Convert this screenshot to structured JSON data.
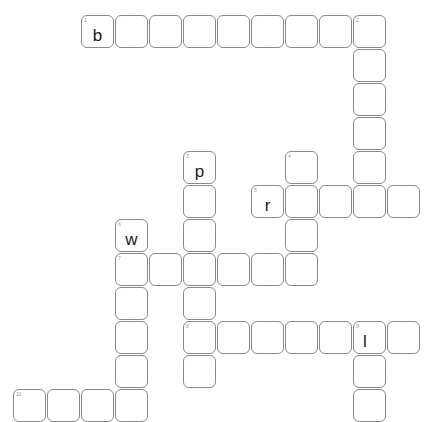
{
  "puzzle": {
    "title": "Crossword Grid",
    "cell_size": 33,
    "cell_pitch": 34,
    "origin_x": 13,
    "origin_y": 15,
    "border_color": "#8a8a8a",
    "number_color": "#9a9a9a",
    "letter_color": "#1a1a1a",
    "background_color": "#ffffff",
    "rows": 12,
    "cols": 12
  },
  "cells": [
    {
      "row": 0,
      "col": 2,
      "number": "1",
      "letter": "b"
    },
    {
      "row": 0,
      "col": 3,
      "number": "",
      "letter": ""
    },
    {
      "row": 0,
      "col": 4,
      "number": "",
      "letter": ""
    },
    {
      "row": 0,
      "col": 5,
      "number": "",
      "letter": ""
    },
    {
      "row": 0,
      "col": 6,
      "number": "",
      "letter": ""
    },
    {
      "row": 0,
      "col": 7,
      "number": "",
      "letter": ""
    },
    {
      "row": 0,
      "col": 8,
      "number": "",
      "letter": ""
    },
    {
      "row": 0,
      "col": 9,
      "number": "",
      "letter": ""
    },
    {
      "row": 0,
      "col": 10,
      "number": "2",
      "letter": ""
    },
    {
      "row": 1,
      "col": 10,
      "number": "",
      "letter": ""
    },
    {
      "row": 2,
      "col": 10,
      "number": "",
      "letter": ""
    },
    {
      "row": 3,
      "col": 10,
      "number": "",
      "letter": ""
    },
    {
      "row": 4,
      "col": 5,
      "number": "3",
      "letter": "p"
    },
    {
      "row": 4,
      "col": 8,
      "number": "4",
      "letter": ""
    },
    {
      "row": 4,
      "col": 10,
      "number": "",
      "letter": ""
    },
    {
      "row": 5,
      "col": 5,
      "number": "",
      "letter": ""
    },
    {
      "row": 5,
      "col": 7,
      "number": "5",
      "letter": "r"
    },
    {
      "row": 5,
      "col": 8,
      "number": "",
      "letter": ""
    },
    {
      "row": 5,
      "col": 9,
      "number": "",
      "letter": ""
    },
    {
      "row": 5,
      "col": 10,
      "number": "",
      "letter": ""
    },
    {
      "row": 5,
      "col": 11,
      "number": "",
      "letter": ""
    },
    {
      "row": 6,
      "col": 3,
      "number": "6",
      "letter": "w"
    },
    {
      "row": 6,
      "col": 5,
      "number": "",
      "letter": ""
    },
    {
      "row": 6,
      "col": 8,
      "number": "",
      "letter": ""
    },
    {
      "row": 7,
      "col": 3,
      "number": "7",
      "letter": ""
    },
    {
      "row": 7,
      "col": 4,
      "number": "",
      "letter": ""
    },
    {
      "row": 7,
      "col": 5,
      "number": "",
      "letter": ""
    },
    {
      "row": 7,
      "col": 6,
      "number": "",
      "letter": ""
    },
    {
      "row": 7,
      "col": 7,
      "number": "",
      "letter": ""
    },
    {
      "row": 7,
      "col": 8,
      "number": "",
      "letter": ""
    },
    {
      "row": 8,
      "col": 3,
      "number": "",
      "letter": ""
    },
    {
      "row": 8,
      "col": 5,
      "number": "",
      "letter": ""
    },
    {
      "row": 9,
      "col": 3,
      "number": "",
      "letter": ""
    },
    {
      "row": 9,
      "col": 5,
      "number": "8",
      "letter": ""
    },
    {
      "row": 9,
      "col": 6,
      "number": "",
      "letter": ""
    },
    {
      "row": 9,
      "col": 7,
      "number": "",
      "letter": ""
    },
    {
      "row": 9,
      "col": 8,
      "number": "",
      "letter": ""
    },
    {
      "row": 9,
      "col": 9,
      "number": "",
      "letter": ""
    },
    {
      "row": 9,
      "col": 10,
      "number": "9",
      "letter": "l"
    },
    {
      "row": 9,
      "col": 11,
      "number": "",
      "letter": ""
    },
    {
      "row": 10,
      "col": 3,
      "number": "",
      "letter": ""
    },
    {
      "row": 10,
      "col": 5,
      "number": "",
      "letter": ""
    },
    {
      "row": 10,
      "col": 10,
      "number": "",
      "letter": ""
    },
    {
      "row": 11,
      "col": 0,
      "number": "10",
      "letter": ""
    },
    {
      "row": 11,
      "col": 1,
      "number": "",
      "letter": ""
    },
    {
      "row": 11,
      "col": 2,
      "number": "",
      "letter": ""
    },
    {
      "row": 11,
      "col": 3,
      "number": "",
      "letter": ""
    },
    {
      "row": 11,
      "col": 10,
      "number": "",
      "letter": ""
    }
  ]
}
